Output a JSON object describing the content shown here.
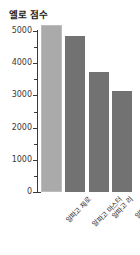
{
  "chart_data": {
    "type": "bar",
    "title": "엘로 점수",
    "xlabel": "",
    "ylabel": "",
    "categories": [
      "알파고 제로",
      "알파고 마스터",
      "알파고 리",
      "알파고 판"
    ],
    "values": [
      5185,
      4858,
      3739,
      3144
    ],
    "ylim": [
      0,
      5200
    ],
    "ytick_labels": [
      "0",
      "1000",
      "2000",
      "3000",
      "4000",
      "5000"
    ],
    "ytick_values": [
      0,
      1000,
      2000,
      3000,
      4000,
      5000
    ],
    "yminor_tick_values": [
      500,
      1500,
      2500,
      3500,
      4500
    ],
    "grid": false,
    "legend": "none",
    "series": [
      {
        "name": "엘로 점수",
        "values": [
          5185,
          4858,
          3739,
          3144
        ]
      }
    ],
    "bar_colors": [
      "#aaaaaa",
      "#727272",
      "#727272",
      "#727272"
    ],
    "axis_color": "#3a3a3a",
    "background": "#ffffff"
  }
}
